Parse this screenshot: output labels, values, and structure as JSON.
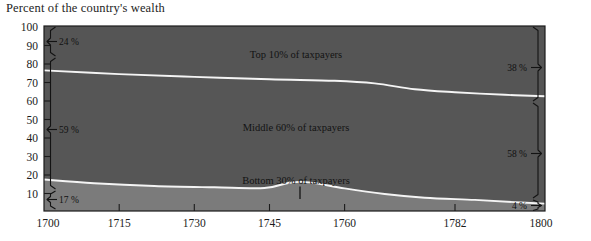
{
  "title": "Percent of the country's wealth",
  "chart_data": {
    "type": "area",
    "title": "Percent of the country's wealth",
    "subtitle": "",
    "xlabel": "",
    "ylabel": "Percent of the country's wealth",
    "stacked": true,
    "grid": false,
    "legend_position": "inline-band-labels",
    "xlim": [
      1700,
      1800
    ],
    "ylim": [
      0,
      100
    ],
    "yticks": [
      100,
      90,
      80,
      70,
      60,
      50,
      40,
      30,
      20,
      10
    ],
    "xticks": [
      1700,
      1715,
      1730,
      1745,
      1760,
      1782,
      1800
    ],
    "x": [
      1700,
      1715,
      1730,
      1745,
      1750,
      1755,
      1760,
      1768,
      1775,
      1782,
      1790,
      1800
    ],
    "series": [
      {
        "name": "Bottom 30% of taxpayers",
        "label": "Bottom 30% of taxpayers",
        "color": "#7b7b7b",
        "values": [
          17,
          14,
          13,
          12,
          15,
          14,
          12,
          9,
          7,
          6,
          5,
          4
        ],
        "start_value": 17,
        "end_value": 4,
        "start_label": "17 %",
        "end_label": "4 %"
      },
      {
        "name": "Middle 60% of taxpayers",
        "label": "Middle 60% of taxpayers",
        "color": "#565656",
        "values": [
          59,
          59,
          59,
          59,
          57,
          57,
          58,
          56,
          56,
          56,
          57,
          58
        ],
        "start_value": 59,
        "end_value": 58,
        "start_label": "59 %",
        "end_label": "58 %"
      },
      {
        "name": "Top 10% of taxpayers",
        "label": "Top 10% of taxpayers",
        "color": "#555555",
        "values": [
          24,
          27,
          28,
          29,
          28,
          29,
          30,
          35,
          37,
          38,
          38,
          38
        ],
        "start_value": 24,
        "end_value": 38,
        "start_label": "24 %",
        "end_label": "38 %"
      }
    ],
    "boundaries": {
      "bottom_top_edge": [
        {
          "x": 1700,
          "y": 17
        },
        {
          "x": 1710,
          "y": 15
        },
        {
          "x": 1722,
          "y": 13.5
        },
        {
          "x": 1734,
          "y": 12.8
        },
        {
          "x": 1744,
          "y": 12.4
        },
        {
          "x": 1749,
          "y": 15.3
        },
        {
          "x": 1753,
          "y": 15.5
        },
        {
          "x": 1760,
          "y": 12.2
        },
        {
          "x": 1768,
          "y": 9.2
        },
        {
          "x": 1776,
          "y": 7.2
        },
        {
          "x": 1786,
          "y": 6.0
        },
        {
          "x": 1794,
          "y": 4.8
        },
        {
          "x": 1800,
          "y": 4.0
        }
      ],
      "middle_top_edge": [
        {
          "x": 1700,
          "y": 76
        },
        {
          "x": 1715,
          "y": 74
        },
        {
          "x": 1730,
          "y": 72.5
        },
        {
          "x": 1745,
          "y": 71.2
        },
        {
          "x": 1758,
          "y": 70.4
        },
        {
          "x": 1766,
          "y": 69.0
        },
        {
          "x": 1774,
          "y": 65.8
        },
        {
          "x": 1782,
          "y": 64.2
        },
        {
          "x": 1792,
          "y": 62.8
        },
        {
          "x": 1800,
          "y": 62.0
        }
      ]
    },
    "annotations": {
      "left": [
        {
          "text": "24 %",
          "value": 24,
          "y_from": 100,
          "y_to": 76
        },
        {
          "text": "59 %",
          "value": 59,
          "y_from": 76,
          "y_to": 17
        },
        {
          "text": "17 %",
          "value": 17,
          "y_from": 17,
          "y_to": 0
        }
      ],
      "right": [
        {
          "text": "38 %",
          "value": 38,
          "y_from": 100,
          "y_to": 62
        },
        {
          "text": "58 %",
          "value": 58,
          "y_from": 62,
          "y_to": 4
        },
        {
          "text": "4 %",
          "value": 4,
          "y_from": 4,
          "y_to": 0
        }
      ],
      "marker": {
        "x": 1750,
        "note": "vertical tick at peak of bottom band"
      }
    }
  },
  "axis": {
    "y_labels": [
      "100",
      "90",
      "80",
      "70",
      "60",
      "50",
      "40",
      "30",
      "20",
      "10"
    ],
    "x_labels": [
      "1700",
      "1715",
      "1730",
      "1745",
      "1760",
      "1782",
      "1800"
    ]
  },
  "band_labels": {
    "top": "Top 10% of taxpayers",
    "middle": "Middle 60% of taxpayers",
    "bottom": "Bottom 30% of taxpayers"
  },
  "annotation_labels": {
    "left_top": "24 %",
    "left_middle": "59 %",
    "left_bottom": "17 %",
    "right_top": "38 %",
    "right_middle": "58 %",
    "right_bottom": "4 %"
  },
  "colors": {
    "band_top": "#555555",
    "band_middle": "#565656",
    "band_bottom": "#7b7b7b",
    "divider": "#f2f2f2",
    "ink": "#1b1b1b",
    "background": "#ffffff"
  }
}
